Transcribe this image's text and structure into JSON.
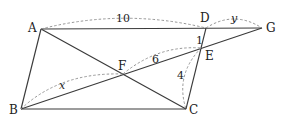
{
  "diagram": {
    "type": "geometry",
    "points": {
      "A": {
        "label": "A",
        "x": 41,
        "y": 29
      },
      "B": {
        "label": "B",
        "x": 21,
        "y": 109
      },
      "C": {
        "label": "C",
        "x": 186,
        "y": 109
      },
      "D": {
        "label": "D",
        "x": 206,
        "y": 28
      },
      "E": {
        "label": "E",
        "x": 201,
        "y": 48
      },
      "F": {
        "label": "F",
        "x": 123,
        "y": 74
      },
      "G": {
        "label": "G",
        "x": 262,
        "y": 28
      }
    },
    "segments": [
      [
        "A",
        "G"
      ],
      [
        "A",
        "B"
      ],
      [
        "B",
        "C"
      ],
      [
        "C",
        "D"
      ],
      [
        "A",
        "C"
      ],
      [
        "B",
        "G"
      ]
    ],
    "measures": {
      "AD": "10",
      "DG": "y",
      "DE": "1",
      "FE": "6",
      "EC": "4",
      "BF": "x"
    }
  }
}
